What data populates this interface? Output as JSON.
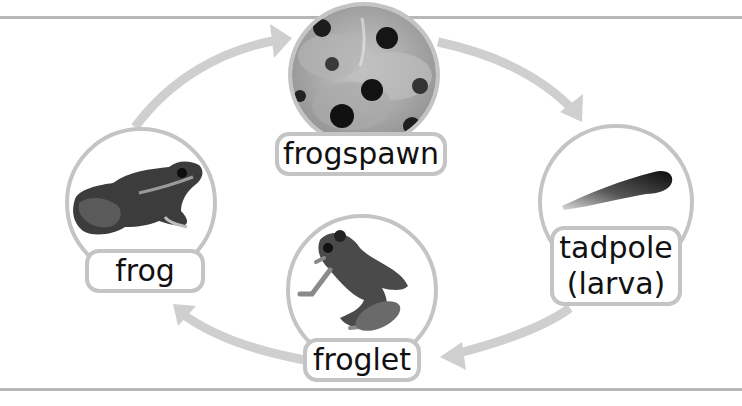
{
  "diagram": {
    "type": "cycle",
    "stages": [
      {
        "id": "frogspawn",
        "label": "frogspawn",
        "image": "frogspawn-photo"
      },
      {
        "id": "tadpole",
        "label_line1": "tadpole",
        "label_line2": "(larva)",
        "image": "tadpole-photo"
      },
      {
        "id": "froglet",
        "label": "froglet",
        "image": "froglet-photo"
      },
      {
        "id": "frog",
        "label": "frog",
        "image": "frog-photo"
      }
    ],
    "arrows": [
      {
        "from": "frog",
        "to": "frogspawn"
      },
      {
        "from": "frogspawn",
        "to": "tadpole"
      },
      {
        "from": "tadpole",
        "to": "froglet"
      },
      {
        "from": "froglet",
        "to": "frog"
      }
    ],
    "colors": {
      "outline": "#c4c4c4",
      "arrow": "#cfcfcf",
      "rule": "#b7b7b7",
      "text": "#111111"
    }
  }
}
